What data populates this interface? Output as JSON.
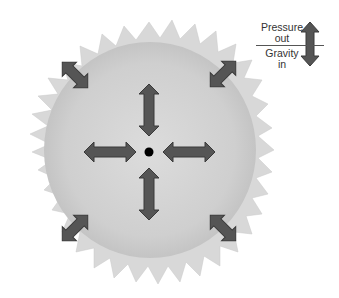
{
  "diagram": {
    "legend": {
      "top_label_line1": "Pressure",
      "top_label_line2": "out",
      "bottom_label_line1": "Gravity",
      "bottom_label_line2": "in",
      "icon": "double-headed-arrow-icon"
    },
    "colors": {
      "corona": "#d6d6d6",
      "core_surface": "#cfcfcf",
      "arrow_fill": "#555555",
      "arrow_stroke": "#3a3a3a",
      "center_dot": "#000000"
    },
    "arrows": [
      {
        "position": "center-top",
        "orientation": "vertical"
      },
      {
        "position": "center-bottom",
        "orientation": "vertical"
      },
      {
        "position": "center-left",
        "orientation": "horizontal"
      },
      {
        "position": "center-right",
        "orientation": "horizontal"
      },
      {
        "position": "edge-top-left",
        "orientation": "diagonal"
      },
      {
        "position": "edge-top-right",
        "orientation": "diagonal"
      },
      {
        "position": "edge-bottom-left",
        "orientation": "diagonal"
      },
      {
        "position": "edge-bottom-right",
        "orientation": "diagonal"
      }
    ]
  }
}
